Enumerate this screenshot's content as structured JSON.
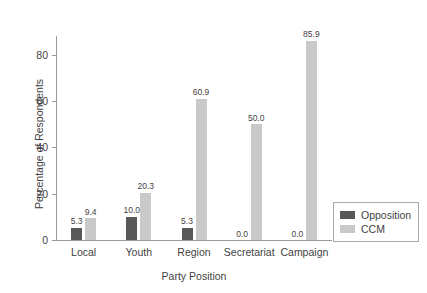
{
  "chart_data": {
    "type": "bar",
    "title": "",
    "xlabel": "Party Position",
    "ylabel": "Percentage of Respondents",
    "categories": [
      "Local",
      "Youth",
      "Region",
      "Secretariat",
      "Campaign"
    ],
    "series": [
      {
        "name": "Opposition",
        "color": "#585858",
        "values": [
          5.3,
          10.0,
          5.3,
          0.0,
          0.0
        ],
        "labels": [
          "5.3",
          "10.0",
          "5.3",
          "0.0",
          "0.0"
        ]
      },
      {
        "name": "CCM",
        "color": "#c9c9c9",
        "values": [
          9.4,
          20.3,
          60.9,
          50.0,
          85.9
        ],
        "labels": [
          "9.4",
          "20.3",
          "60.9",
          "50.0",
          "85.9"
        ]
      }
    ],
    "ylim": [
      0,
      88
    ],
    "yticks": [
      0,
      20,
      40,
      60,
      80
    ],
    "ytick_labels": [
      "0",
      "20",
      "40",
      "60",
      "80"
    ],
    "grid": false,
    "legend_position": "right",
    "bar_value_labels": true
  }
}
